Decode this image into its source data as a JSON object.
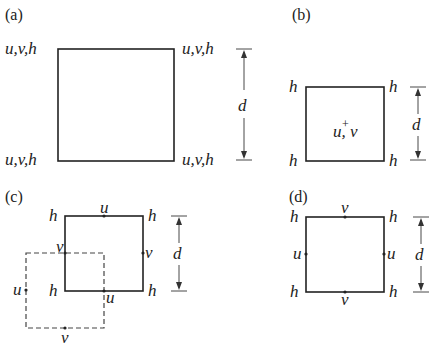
{
  "panels": {
    "a": {
      "label": "(a)",
      "corner_tl": "u,v,h",
      "corner_tr": "u,v,h",
      "corner_bl": "u,v,h",
      "corner_br": "u,v,h",
      "dimension": "d"
    },
    "b": {
      "label": "(b)",
      "corner_tl": "h",
      "corner_tr": "h",
      "corner_bl": "h",
      "corner_br": "h",
      "center_plus": "+",
      "center": "u, v",
      "dimension": "d"
    },
    "c": {
      "label": "(c)",
      "corner_tl": "h",
      "corner_tr": "h",
      "corner_bl": "h",
      "corner_br": "h",
      "top_mid": "u",
      "left_mid": "v",
      "right_mid": "v",
      "bottom_mid": "u",
      "dashed_left_mid": "u",
      "dashed_bottom_mid": "v",
      "dimension": "d"
    },
    "d": {
      "label": "(d)",
      "corner_tl": "h",
      "corner_tr": "h",
      "corner_bl": "h",
      "corner_br": "h",
      "top_mid": "v",
      "bottom_mid": "v",
      "left_mid": "u",
      "right_mid": "u",
      "dimension": "d"
    }
  }
}
